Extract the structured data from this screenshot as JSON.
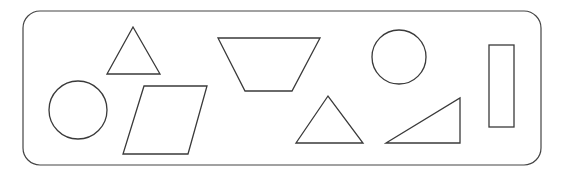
{
  "diagram": {
    "title": "",
    "stroke_color": "#3a3a3a",
    "fill_color": "#ffffff",
    "shapes": [
      {
        "id": "triangle-top-left",
        "kind": "triangle"
      },
      {
        "id": "circle-left",
        "kind": "circle"
      },
      {
        "id": "parallelogram",
        "kind": "parallelogram"
      },
      {
        "id": "trapezoid",
        "kind": "trapezoid"
      },
      {
        "id": "circle-right",
        "kind": "circle"
      },
      {
        "id": "triangle-bottom-middle",
        "kind": "triangle"
      },
      {
        "id": "right-triangle",
        "kind": "right-triangle"
      },
      {
        "id": "rectangle",
        "kind": "rectangle"
      }
    ]
  }
}
